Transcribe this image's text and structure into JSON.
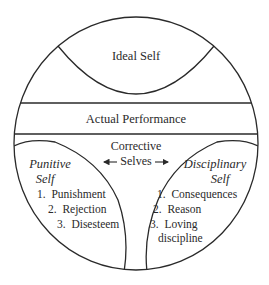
{
  "diagram": {
    "regions": {
      "ideal_self": {
        "label": "Ideal Self"
      },
      "actual_performance": {
        "label": "Actual Performance"
      },
      "corrective_selves": {
        "line1": "Corrective",
        "line2": "Selves"
      },
      "punitive_self": {
        "title_line1": "Punitive",
        "title_line2": "Self",
        "items": [
          "1.  Punishment",
          "2.  Rejection",
          "3.  Disesteem"
        ]
      },
      "disciplinary_self": {
        "title_line1": "Disciplinary",
        "title_line2": "Self",
        "items": [
          "1.  Consequences",
          "2.  Reason",
          "3.  Loving",
          "discipline"
        ]
      }
    },
    "colors": {
      "stroke": "#2a2a2a",
      "background": "#ffffff"
    }
  }
}
